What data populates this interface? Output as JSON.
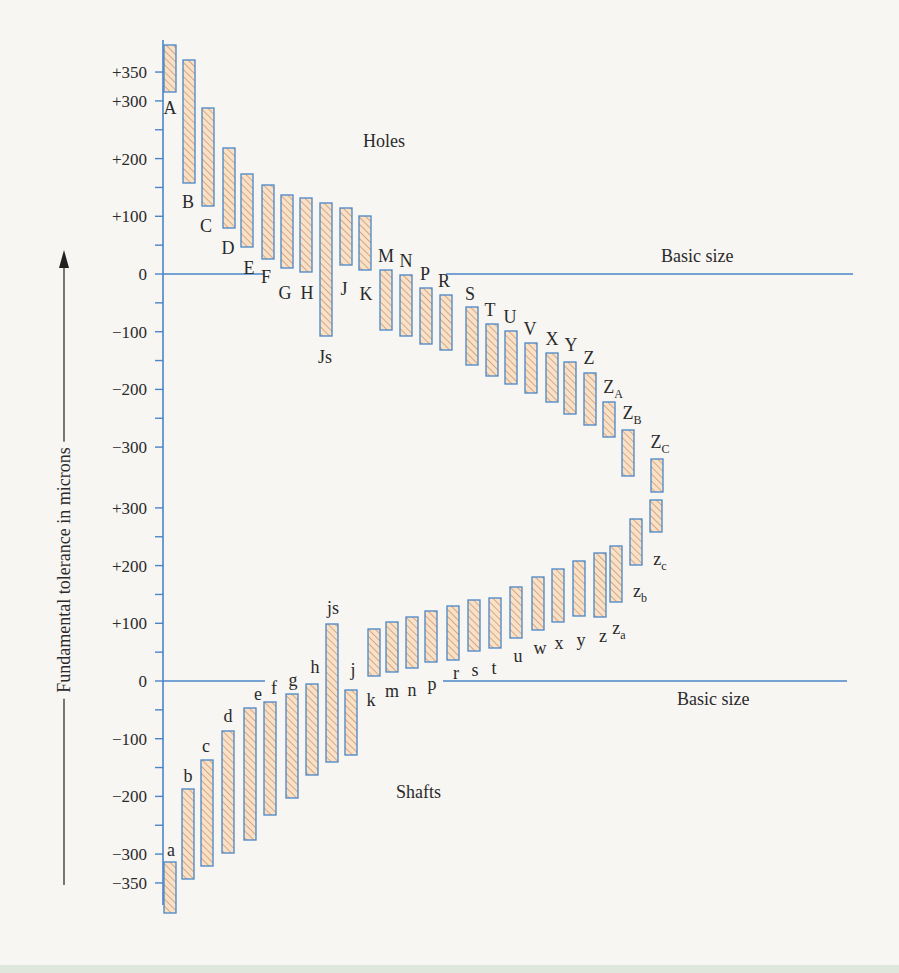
{
  "figure": {
    "y_axis_label": "Fundamental tolerance in microns",
    "holes_label": "Holes",
    "shafts_label": "Shafts",
    "basic_size_label_top": "Basic size",
    "basic_size_label_bottom": "Basic size"
  },
  "colors": {
    "axis_blue": "#4a86c8",
    "bar_fill": "#f6e2c8",
    "hatch": "#d9946a",
    "text": "#2a2a2a",
    "background": "#f7f6f3"
  },
  "chart_data": [
    {
      "type": "bar",
      "title": "Holes",
      "ylabel": "Fundamental tolerance in microns",
      "reference_line": "Basic size (0)",
      "tick_labels": [
        "+350",
        "+300",
        "+200",
        "+100",
        "0",
        "-100",
        "-200",
        "-300"
      ],
      "ylim": [
        -340,
        400
      ],
      "categories": [
        "A",
        "B",
        "C",
        "D",
        "E",
        "F",
        "G",
        "H",
        "Js",
        "J",
        "K",
        "M",
        "N",
        "P",
        "R",
        "S",
        "T",
        "U",
        "V",
        "X",
        "Y",
        "Z",
        "ZA",
        "ZB",
        "ZC"
      ],
      "series": [
        {
          "name": "upper",
          "values": [
            395,
            365,
            285,
            215,
            170,
            150,
            135,
            130,
            120,
            110,
            100,
            -5,
            -10,
            -25,
            -35,
            -60,
            -85,
            -95,
            -105,
            -125,
            -135,
            -155,
            -210,
            -255,
            -320
          ]
        },
        {
          "name": "lower",
          "values": [
            320,
            155,
            115,
            80,
            45,
            25,
            10,
            0,
            -110,
            15,
            5,
            -95,
            -105,
            -115,
            -125,
            -155,
            -175,
            -190,
            -205,
            -220,
            -240,
            -260,
            -280,
            -300,
            -320
          ]
        }
      ]
    },
    {
      "type": "bar",
      "title": "Shafts",
      "ylabel": "Fundamental tolerance in microns",
      "reference_line": "Basic size (0)",
      "tick_labels": [
        "+300",
        "+200",
        "+100",
        "0",
        "-100",
        "-200",
        "-300",
        "-350"
      ],
      "ylim": [
        -390,
        330
      ],
      "categories": [
        "a",
        "b",
        "c",
        "d",
        "e",
        "f",
        "g",
        "h",
        "js",
        "j",
        "k",
        "m",
        "n",
        "p",
        "r",
        "s",
        "t",
        "u",
        "w",
        "x",
        "y",
        "z",
        "za",
        "zb",
        "zc"
      ],
      "series": [
        {
          "name": "upper",
          "values": [
            -310,
            -185,
            -135,
            -85,
            -45,
            -35,
            -25,
            -5,
            100,
            -20,
            90,
            95,
            100,
            105,
            110,
            120,
            115,
            135,
            150,
            165,
            175,
            185,
            200,
            235,
            265
          ]
        },
        {
          "name": "lower",
          "values": [
            -390,
            -335,
            -315,
            -295,
            -275,
            -235,
            -205,
            -165,
            -135,
            -130,
            10,
            15,
            25,
            35,
            45,
            55,
            60,
            75,
            90,
            100,
            110,
            120,
            135,
            180,
            215
          ]
        }
      ]
    }
  ],
  "axis": {
    "upper_ticks": [
      {
        "label": "+350",
        "value": 350
      },
      {
        "label": "+300",
        "value": 300
      },
      {
        "label": "+200",
        "value": 200
      },
      {
        "label": "+100",
        "value": 100
      },
      {
        "label": "0",
        "value": 0
      },
      {
        "label": "−100",
        "value": -100
      },
      {
        "label": "−200",
        "value": -200
      },
      {
        "label": "−300",
        "value": -300
      }
    ],
    "lower_ticks": [
      {
        "label": "+300",
        "value": 300
      },
      {
        "label": "+200",
        "value": 200
      },
      {
        "label": "+100",
        "value": 100
      },
      {
        "label": "0",
        "value": 0
      },
      {
        "label": "−100",
        "value": -100
      },
      {
        "label": "−200",
        "value": -200
      },
      {
        "label": "−300",
        "value": -300
      },
      {
        "label": "−350",
        "value": -350
      }
    ]
  },
  "holes": [
    {
      "label": "A",
      "sub": "",
      "x": 170,
      "top": 45,
      "bot": 92,
      "lx": 170,
      "ly": 108,
      "lpos": "below"
    },
    {
      "label": "B",
      "sub": "",
      "x": 189,
      "top": 60,
      "bot": 183,
      "lx": 188,
      "ly": 202,
      "lpos": "below"
    },
    {
      "label": "C",
      "sub": "",
      "x": 208,
      "top": 108,
      "bot": 206,
      "lx": 206,
      "ly": 226,
      "lpos": "below"
    },
    {
      "label": "D",
      "sub": "",
      "x": 229,
      "top": 148,
      "bot": 228,
      "lx": 228,
      "ly": 248,
      "lpos": "below"
    },
    {
      "label": "E",
      "sub": "",
      "x": 247,
      "top": 174,
      "bot": 247,
      "lx": 249,
      "ly": 268,
      "lpos": "below"
    },
    {
      "label": "F",
      "sub": "",
      "x": 268,
      "top": 185,
      "bot": 259,
      "lx": 266,
      "ly": 277,
      "lpos": "below"
    },
    {
      "label": "G",
      "sub": "",
      "x": 287,
      "top": 195,
      "bot": 268,
      "lx": 285,
      "ly": 293,
      "lpos": "below"
    },
    {
      "label": "H",
      "sub": "",
      "x": 306,
      "top": 198,
      "bot": 272,
      "lx": 307,
      "ly": 293,
      "lpos": "below"
    },
    {
      "label": "Js",
      "sub": "",
      "x": 326,
      "top": 203,
      "bot": 336,
      "lx": 325,
      "ly": 357,
      "lpos": "below"
    },
    {
      "label": "J",
      "sub": "",
      "x": 346,
      "top": 208,
      "bot": 265,
      "lx": 344,
      "ly": 289,
      "lpos": "below"
    },
    {
      "label": "K",
      "sub": "",
      "x": 365,
      "top": 216,
      "bot": 270,
      "lx": 366,
      "ly": 294,
      "lpos": "below"
    },
    {
      "label": "M",
      "sub": "",
      "x": 386,
      "top": 270,
      "bot": 330,
      "lx": 386,
      "ly": 262,
      "lpos": "above"
    },
    {
      "label": "N",
      "sub": "",
      "x": 406,
      "top": 275,
      "bot": 336,
      "lx": 406,
      "ly": 267,
      "lpos": "above"
    },
    {
      "label": "P",
      "sub": "",
      "x": 426,
      "top": 288,
      "bot": 344,
      "lx": 425,
      "ly": 280,
      "lpos": "above"
    },
    {
      "label": "R",
      "sub": "",
      "x": 446,
      "top": 295,
      "bot": 350,
      "lx": 444,
      "ly": 287,
      "lpos": "above"
    },
    {
      "label": "S",
      "sub": "",
      "x": 472,
      "top": 307,
      "bot": 365,
      "lx": 470,
      "ly": 300,
      "lpos": "above"
    },
    {
      "label": "T",
      "sub": "",
      "x": 492,
      "top": 324,
      "bot": 376,
      "lx": 490,
      "ly": 316,
      "lpos": "above"
    },
    {
      "label": "U",
      "sub": "",
      "x": 511,
      "top": 331,
      "bot": 384,
      "lx": 510,
      "ly": 323,
      "lpos": "above"
    },
    {
      "label": "V",
      "sub": "",
      "x": 531,
      "top": 343,
      "bot": 393,
      "lx": 530,
      "ly": 335,
      "lpos": "above"
    },
    {
      "label": "X",
      "sub": "",
      "x": 552,
      "top": 353,
      "bot": 402,
      "lx": 552,
      "ly": 345,
      "lpos": "above"
    },
    {
      "label": "Y",
      "sub": "",
      "x": 570,
      "top": 362,
      "bot": 414,
      "lx": 571,
      "ly": 351,
      "lpos": "above"
    },
    {
      "label": "Z",
      "sub": "",
      "x": 590,
      "top": 373,
      "bot": 425,
      "lx": 589,
      "ly": 364,
      "lpos": "above"
    },
    {
      "label": "Z",
      "sub": "A",
      "x": 609,
      "top": 402,
      "bot": 437,
      "lx": 613,
      "ly": 393,
      "lpos": "above"
    },
    {
      "label": "Z",
      "sub": "B",
      "x": 628,
      "top": 430,
      "bot": 476,
      "lx": 632,
      "ly": 419,
      "lpos": "above"
    },
    {
      "label": "Z",
      "sub": "C",
      "x": 657,
      "top": 459,
      "bot": 492,
      "lx": 660,
      "ly": 448,
      "lpos": "above"
    }
  ],
  "shafts": [
    {
      "label": "a",
      "sub": "",
      "x": 170,
      "top": 862,
      "bot": 913,
      "lx": 171,
      "ly": 856,
      "lpos": "above"
    },
    {
      "label": "b",
      "sub": "",
      "x": 188,
      "top": 789,
      "bot": 879,
      "lx": 188,
      "ly": 782,
      "lpos": "above"
    },
    {
      "label": "c",
      "sub": "",
      "x": 207,
      "top": 760,
      "bot": 866,
      "lx": 206,
      "ly": 752,
      "lpos": "above"
    },
    {
      "label": "d",
      "sub": "",
      "x": 228,
      "top": 731,
      "bot": 853,
      "lx": 228,
      "ly": 722,
      "lpos": "above"
    },
    {
      "label": "e",
      "sub": "",
      "x": 250,
      "top": 708,
      "bot": 840,
      "lx": 258,
      "ly": 700,
      "lpos": "above"
    },
    {
      "label": "f",
      "sub": "",
      "x": 270,
      "top": 702,
      "bot": 815,
      "lx": 274,
      "ly": 694,
      "lpos": "above"
    },
    {
      "label": "g",
      "sub": "",
      "x": 292,
      "top": 694,
      "bot": 798,
      "lx": 293,
      "ly": 686,
      "lpos": "above"
    },
    {
      "label": "h",
      "sub": "",
      "x": 312,
      "top": 684,
      "bot": 775,
      "lx": 315,
      "ly": 673,
      "lpos": "above"
    },
    {
      "label": "js",
      "sub": "",
      "x": 332,
      "top": 624,
      "bot": 762,
      "lx": 333,
      "ly": 614,
      "lpos": "above"
    },
    {
      "label": "j",
      "sub": "",
      "x": 351,
      "top": 690,
      "bot": 755,
      "lx": 353,
      "ly": 676,
      "lpos": "above"
    },
    {
      "label": "k",
      "sub": "",
      "x": 374,
      "top": 629,
      "bot": 676,
      "lx": 371,
      "ly": 700,
      "lpos": "below"
    },
    {
      "label": "m",
      "sub": "",
      "x": 392,
      "top": 622,
      "bot": 672,
      "lx": 392,
      "ly": 691,
      "lpos": "below"
    },
    {
      "label": "n",
      "sub": "",
      "x": 412,
      "top": 617,
      "bot": 668,
      "lx": 412,
      "ly": 690,
      "lpos": "below"
    },
    {
      "label": "p",
      "sub": "",
      "x": 431,
      "top": 611,
      "bot": 662,
      "lx": 432,
      "ly": 684,
      "lpos": "below"
    },
    {
      "label": "r",
      "sub": "",
      "x": 453,
      "top": 606,
      "bot": 660,
      "lx": 456,
      "ly": 673,
      "lpos": "below"
    },
    {
      "label": "s",
      "sub": "",
      "x": 474,
      "top": 600,
      "bot": 651,
      "lx": 475,
      "ly": 670,
      "lpos": "below"
    },
    {
      "label": "t",
      "sub": "",
      "x": 495,
      "top": 598,
      "bot": 648,
      "lx": 494,
      "ly": 668,
      "lpos": "below"
    },
    {
      "label": "u",
      "sub": "",
      "x": 516,
      "top": 587,
      "bot": 638,
      "lx": 518,
      "ly": 656,
      "lpos": "below"
    },
    {
      "label": "w",
      "sub": "",
      "x": 538,
      "top": 577,
      "bot": 630,
      "lx": 540,
      "ly": 648,
      "lpos": "below"
    },
    {
      "label": "x",
      "sub": "",
      "x": 558,
      "top": 569,
      "bot": 622,
      "lx": 559,
      "ly": 643,
      "lpos": "below"
    },
    {
      "label": "y",
      "sub": "",
      "x": 579,
      "top": 561,
      "bot": 616,
      "lx": 581,
      "ly": 640,
      "lpos": "below"
    },
    {
      "label": "z",
      "sub": "",
      "x": 600,
      "top": 553,
      "bot": 617,
      "lx": 603,
      "ly": 636,
      "lpos": "below"
    },
    {
      "label": "z",
      "sub": "a",
      "x": 616,
      "top": 546,
      "bot": 602,
      "lx": 619,
      "ly": 628,
      "lpos": "below"
    },
    {
      "label": "z",
      "sub": "b",
      "x": 636,
      "top": 519,
      "bot": 565,
      "lx": 640,
      "ly": 591,
      "lpos": "below"
    },
    {
      "label": "z",
      "sub": "c",
      "x": 656,
      "top": 500,
      "bot": 532,
      "lx": 660,
      "ly": 559,
      "lpos": "below"
    }
  ]
}
